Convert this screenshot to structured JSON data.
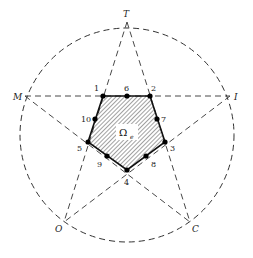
{
  "figure": {
    "outer_labels": [
      "T",
      "I",
      "C",
      "O",
      "M"
    ],
    "element_label": "Ω",
    "element_subscript": "e",
    "node_labels": [
      "1",
      "2",
      "3",
      "4",
      "5",
      "6",
      "7",
      "8",
      "9",
      "10"
    ],
    "colors": {
      "line": "#333333",
      "fill_hatch": "#444444",
      "node": "#000000"
    }
  }
}
